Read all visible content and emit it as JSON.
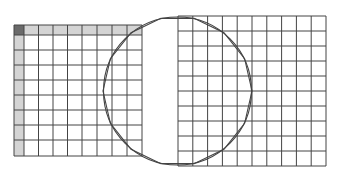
{
  "diagram": {
    "width": 337,
    "height": 179,
    "background": "#ffffff",
    "line_color": "#444444",
    "left_grid": {
      "x_lines": [
        14,
        24,
        38.5,
        53,
        67.5,
        82,
        97,
        112,
        127,
        142
      ],
      "y_lines": [
        25,
        35,
        50,
        65,
        80,
        95,
        110,
        125,
        140,
        156
      ],
      "header_fill": "#d4d4d4",
      "corner_fill": "#6a6a6a"
    },
    "right_grid": {
      "x": 178,
      "y": 16,
      "width": 148,
      "height": 150,
      "cols": 10,
      "rows": 10
    },
    "circle": {
      "cx": 177.5,
      "cy": 91,
      "r": 74
    },
    "polygon": {
      "cx": 177.5,
      "cy": 91,
      "r": 74.5,
      "sides": 14,
      "rotation_deg": 0
    }
  }
}
